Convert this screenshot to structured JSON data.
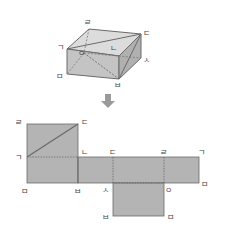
{
  "cube": {
    "vertices": {
      "top_back_left": "ㄹ",
      "top_back_right": "ㄷ",
      "top_front_left": "ㄱ",
      "top_front_right": "ㄴ",
      "bottom_back_left": "ㅇ",
      "bottom_back_right": "ㅅ",
      "bottom_front_left": "ㅁ",
      "bottom_front_right": "ㅂ"
    }
  },
  "arrow": {
    "icon": "down-arrow-icon",
    "color": "#9a9a9a"
  },
  "net": {
    "labels": {
      "sq_top_left": "ㄹ",
      "sq_top_right": "ㄷ",
      "sq_mid_left": "ㄱ",
      "sq_mid_right": "ㄴ",
      "bottom_left": "ㅁ",
      "bottom_mid1": "ㅂ",
      "strip_top_1": "ㄷ",
      "strip_top_2": "ㄹ",
      "strip_top_end": "ㄱ",
      "strip_bottom_1": "ㅅ",
      "strip_bottom_2": "ㅇ",
      "strip_bottom_end": "ㅁ",
      "flap_bottom_left": "ㅂ",
      "flap_bottom_right": "ㅁ"
    }
  },
  "colors": {
    "face": "#b4b4b4",
    "face_light": "#d2d2d2",
    "edge": "#6a6a6a",
    "dash": "#7a7a7a"
  }
}
